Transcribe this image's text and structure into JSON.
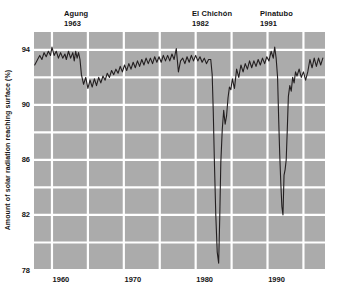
{
  "chart_data": {
    "type": "line",
    "title": "",
    "xlabel": "",
    "ylabel": "Amount of solar radiation reaching surface (%)",
    "xlim": [
      1957.5,
      1998.0
    ],
    "ylim": [
      78.0,
      95.3
    ],
    "xticks": [
      1960,
      1970,
      1980,
      1990
    ],
    "xticklabels": [
      "1960",
      "1970",
      "1980",
      "1990"
    ],
    "yticks": [
      78,
      82,
      86,
      90,
      94
    ],
    "yticklabels": [
      "78",
      "82",
      "86",
      "90",
      "94"
    ],
    "grid": true,
    "grid_color": "#ffffff",
    "plot_background": "#ababab",
    "line_color": "#231f20",
    "legend": "none",
    "annotations": [
      {
        "name": "Agung",
        "year": "1963",
        "x": 1963
      },
      {
        "name": "El Chichón",
        "year": "1982",
        "x": 1982
      },
      {
        "name": "Pinatubo",
        "year": "1991",
        "x": 1991
      }
    ],
    "series": [
      {
        "name": "Amount of solar radiation reaching surface",
        "x": [
          1957.6,
          1958.0,
          1958.3,
          1958.6,
          1958.9,
          1959.2,
          1959.5,
          1959.8,
          1960.0,
          1960.3,
          1960.6,
          1960.9,
          1961.2,
          1961.5,
          1961.8,
          1962.0,
          1962.3,
          1962.6,
          1962.9,
          1963.1,
          1963.3,
          1963.5,
          1963.7,
          1963.9,
          1964.1,
          1964.4,
          1964.7,
          1965.0,
          1965.3,
          1965.6,
          1965.9,
          1966.2,
          1966.5,
          1966.8,
          1967.1,
          1967.4,
          1967.7,
          1968.0,
          1968.3,
          1968.6,
          1968.9,
          1969.2,
          1969.5,
          1969.8,
          1970.1,
          1970.4,
          1970.7,
          1971.0,
          1971.3,
          1971.6,
          1971.9,
          1972.2,
          1972.5,
          1972.8,
          1973.1,
          1973.4,
          1973.7,
          1974.0,
          1974.3,
          1974.6,
          1974.9,
          1975.2,
          1975.5,
          1975.8,
          1976.1,
          1976.4,
          1976.7,
          1977.0,
          1977.3,
          1977.6,
          1977.9,
          1978.2,
          1978.5,
          1978.8,
          1979.1,
          1979.4,
          1979.7,
          1980.0,
          1980.3,
          1980.6,
          1980.9,
          1981.2,
          1981.5,
          1981.8,
          1982.1,
          1982.3,
          1982.45,
          1982.6,
          1982.8,
          1983.0,
          1983.2,
          1983.35,
          1983.5,
          1983.7,
          1983.9,
          1984.1,
          1984.3,
          1984.5,
          1984.7,
          1984.9,
          1985.1,
          1985.4,
          1985.7,
          1986.0,
          1986.3,
          1986.6,
          1986.9,
          1987.2,
          1987.5,
          1987.8,
          1988.1,
          1988.4,
          1988.7,
          1989.0,
          1989.3,
          1989.6,
          1989.9,
          1990.2,
          1990.5,
          1990.8,
          1991.0,
          1991.2,
          1991.4,
          1991.55,
          1991.7,
          1991.85,
          1992.0,
          1992.15,
          1992.3,
          1992.45,
          1992.6,
          1992.75,
          1992.9,
          1993.1,
          1993.3,
          1993.5,
          1993.7,
          1993.9,
          1994.1,
          1994.4,
          1994.7,
          1995.0,
          1995.3,
          1995.6,
          1995.9,
          1996.2,
          1996.5,
          1996.8,
          1997.1,
          1997.4,
          1997.7
        ],
        "y": [
          92.9,
          93.3,
          93.6,
          93.3,
          93.8,
          93.5,
          93.9,
          93.6,
          94.2,
          93.6,
          93.9,
          93.4,
          93.8,
          93.4,
          93.7,
          93.3,
          93.9,
          93.4,
          93.8,
          93.2,
          93.9,
          93.4,
          93.8,
          93.3,
          92.2,
          91.5,
          92.0,
          91.2,
          91.8,
          91.3,
          91.9,
          91.4,
          92.0,
          91.6,
          92.1,
          91.8,
          92.3,
          92.0,
          92.5,
          92.2,
          92.6,
          92.3,
          92.8,
          92.4,
          92.9,
          92.5,
          93.0,
          92.6,
          93.1,
          92.7,
          93.2,
          92.8,
          93.3,
          92.9,
          93.4,
          93.0,
          93.4,
          93.0,
          93.5,
          93.1,
          93.5,
          93.1,
          93.6,
          93.2,
          93.6,
          93.2,
          93.7,
          93.3,
          94.1,
          92.4,
          93.2,
          93.4,
          93.0,
          93.5,
          93.1,
          93.6,
          93.2,
          93.6,
          93.2,
          93.5,
          93.1,
          93.4,
          93.0,
          93.3,
          93.3,
          92.2,
          89.5,
          86.0,
          82.0,
          79.3,
          78.5,
          81.8,
          85.8,
          88.2,
          89.6,
          88.6,
          89.2,
          90.5,
          91.3,
          91.1,
          91.9,
          91.2,
          92.6,
          92.0,
          92.9,
          92.4,
          93.0,
          92.6,
          93.2,
          92.7,
          93.2,
          92.8,
          93.3,
          92.9,
          93.4,
          93.0,
          93.5,
          93.2,
          93.9,
          93.4,
          94.2,
          93.4,
          92.0,
          89.0,
          86.4,
          84.3,
          82.6,
          82.0,
          84.9,
          85.3,
          86.0,
          88.2,
          90.6,
          91.4,
          91.0,
          92.0,
          91.6,
          92.4,
          92.1,
          92.6,
          92.0,
          92.4,
          91.8,
          92.4,
          93.3,
          92.7,
          93.4,
          92.8,
          93.4,
          92.9,
          93.4
        ]
      }
    ]
  }
}
